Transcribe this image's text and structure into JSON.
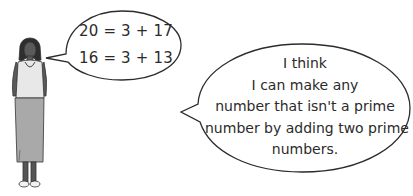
{
  "character": {
    "description": "woman standing",
    "colors": {
      "skin": "#4a4a4a",
      "top": "#e6e6e6",
      "skirt": "#a8a8a8",
      "outline": "#333333"
    }
  },
  "small_bubble": {
    "lines": [
      "20 = 3 + 17",
      "16 = 3 + 13"
    ]
  },
  "large_bubble": {
    "lines": [
      "I think",
      "I can make any",
      "number that isn't a prime",
      "number by adding two prime",
      "numbers."
    ]
  }
}
